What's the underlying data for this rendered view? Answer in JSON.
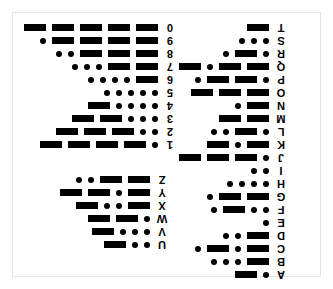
{
  "document": {
    "kind": "morse-code-chart",
    "header_note": "",
    "border_color": "#e3e3e3",
    "ink_color": "#000000",
    "background_color": "#ffffff",
    "dot_glyph": "dot",
    "dash_glyph": "dash",
    "reading_order": "right-to-left",
    "label_rotation_degrees": 180
  },
  "chart_data": {
    "type": "table",
    "xlabel": "",
    "ylabel": "",
    "legend": [
      "dot",
      "dash"
    ],
    "blocks": [
      {
        "id": "digits",
        "name": "digits-block",
        "position": "top-left",
        "rows": [
          {
            "label": "0",
            "code": [
              "dash",
              "dash",
              "dash",
              "dash",
              "dash"
            ]
          },
          {
            "label": "9",
            "code": [
              "dash",
              "dash",
              "dash",
              "dash",
              "dot"
            ]
          },
          {
            "label": "8",
            "code": [
              "dash",
              "dash",
              "dash",
              "dot",
              "dot"
            ]
          },
          {
            "label": "7",
            "code": [
              "dash",
              "dash",
              "dot",
              "dot",
              "dot"
            ]
          },
          {
            "label": "6",
            "code": [
              "dash",
              "dot",
              "dot",
              "dot",
              "dot"
            ]
          },
          {
            "label": "5",
            "code": [
              "dot",
              "dot",
              "dot",
              "dot",
              "dot"
            ]
          },
          {
            "label": "4",
            "code": [
              "dot",
              "dot",
              "dot",
              "dot",
              "dash"
            ]
          },
          {
            "label": "3",
            "code": [
              "dot",
              "dot",
              "dot",
              "dash",
              "dash"
            ]
          },
          {
            "label": "2",
            "code": [
              "dot",
              "dot",
              "dash",
              "dash",
              "dash"
            ]
          },
          {
            "label": "1",
            "code": [
              "dot",
              "dash",
              "dash",
              "dash",
              "dash"
            ]
          }
        ]
      },
      {
        "id": "letters-a-t",
        "name": "letters-a-to-t-block",
        "position": "right",
        "rows": [
          {
            "label": "T",
            "code": [
              "dash"
            ]
          },
          {
            "label": "S",
            "code": [
              "dot",
              "dot",
              "dot"
            ]
          },
          {
            "label": "R",
            "code": [
              "dot",
              "dash",
              "dot"
            ]
          },
          {
            "label": "Q",
            "code": [
              "dash",
              "dash",
              "dot",
              "dash"
            ]
          },
          {
            "label": "P",
            "code": [
              "dot",
              "dash",
              "dash",
              "dot"
            ]
          },
          {
            "label": "O",
            "code": [
              "dash",
              "dash",
              "dash"
            ]
          },
          {
            "label": "N",
            "code": [
              "dash",
              "dot"
            ]
          },
          {
            "label": "M",
            "code": [
              "dash",
              "dash"
            ]
          },
          {
            "label": "L",
            "code": [
              "dot",
              "dash",
              "dot",
              "dot"
            ]
          },
          {
            "label": "K",
            "code": [
              "dash",
              "dot",
              "dash"
            ]
          },
          {
            "label": "J",
            "code": [
              "dot",
              "dash",
              "dash",
              "dash"
            ]
          },
          {
            "label": "I",
            "code": [
              "dot",
              "dot"
            ]
          },
          {
            "label": "H",
            "code": [
              "dot",
              "dot",
              "dot",
              "dot"
            ]
          },
          {
            "label": "G",
            "code": [
              "dash",
              "dash",
              "dot"
            ]
          },
          {
            "label": "F",
            "code": [
              "dot",
              "dot",
              "dash",
              "dot"
            ]
          },
          {
            "label": "E",
            "code": [
              "dot"
            ]
          },
          {
            "label": "D",
            "code": [
              "dash",
              "dot",
              "dot"
            ]
          },
          {
            "label": "C",
            "code": [
              "dash",
              "dot",
              "dash",
              "dot"
            ]
          },
          {
            "label": "B",
            "code": [
              "dash",
              "dot",
              "dot",
              "dot"
            ]
          },
          {
            "label": "A",
            "code": [
              "dot",
              "dash"
            ]
          }
        ]
      },
      {
        "id": "letters-u-z",
        "name": "letters-u-to-z-block",
        "position": "bottom-left",
        "rows": [
          {
            "label": "Z",
            "code": [
              "dash",
              "dash",
              "dot",
              "dot"
            ]
          },
          {
            "label": "Y",
            "code": [
              "dash",
              "dot",
              "dash",
              "dash"
            ]
          },
          {
            "label": "X",
            "code": [
              "dash",
              "dot",
              "dot",
              "dash"
            ]
          },
          {
            "label": "W",
            "code": [
              "dot",
              "dash",
              "dash"
            ]
          },
          {
            "label": "V",
            "code": [
              "dot",
              "dot",
              "dot",
              "dash"
            ]
          },
          {
            "label": "U",
            "code": [
              "dot",
              "dot",
              "dash"
            ]
          }
        ]
      }
    ]
  }
}
